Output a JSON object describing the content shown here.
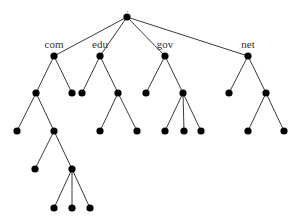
{
  "diagram": {
    "type": "tree",
    "root": {
      "id": "root",
      "label": ".",
      "children": [
        {
          "id": "com",
          "label": "com",
          "children": [
            {
              "id": "com-1",
              "label": "",
              "children": [
                {
                  "id": "com-1-1",
                  "label": "",
                  "children": []
                },
                {
                  "id": "com-1-2",
                  "label": "",
                  "children": [
                    {
                      "id": "com-1-2-1",
                      "label": "",
                      "children": []
                    },
                    {
                      "id": "com-1-2-2",
                      "label": "",
                      "children": [
                        {
                          "id": "com-1-2-2-1",
                          "label": "",
                          "children": []
                        },
                        {
                          "id": "com-1-2-2-2",
                          "label": "",
                          "children": []
                        },
                        {
                          "id": "com-1-2-2-3",
                          "label": "",
                          "children": []
                        }
                      ]
                    }
                  ]
                }
              ]
            },
            {
              "id": "com-2",
              "label": "",
              "children": []
            }
          ]
        },
        {
          "id": "edu",
          "label": "edu",
          "children": [
            {
              "id": "edu-1",
              "label": "",
              "children": []
            },
            {
              "id": "edu-2",
              "label": "",
              "children": [
                {
                  "id": "edu-2-1",
                  "label": "",
                  "children": []
                },
                {
                  "id": "edu-2-2",
                  "label": "",
                  "children": []
                }
              ]
            }
          ]
        },
        {
          "id": "gov",
          "label": "gov",
          "children": [
            {
              "id": "gov-1",
              "label": "",
              "children": []
            },
            {
              "id": "gov-2",
              "label": "",
              "children": [
                {
                  "id": "gov-2-1",
                  "label": "",
                  "children": []
                },
                {
                  "id": "gov-2-2",
                  "label": "",
                  "children": []
                },
                {
                  "id": "gov-2-3",
                  "label": "",
                  "children": []
                }
              ]
            }
          ]
        },
        {
          "id": "net",
          "label": "net",
          "children": [
            {
              "id": "net-1",
              "label": "",
              "children": []
            },
            {
              "id": "net-2",
              "label": "",
              "children": [
                {
                  "id": "net-2-1",
                  "label": "",
                  "children": []
                },
                {
                  "id": "net-2-2",
                  "label": "",
                  "children": []
                }
              ]
            }
          ]
        }
      ]
    }
  }
}
